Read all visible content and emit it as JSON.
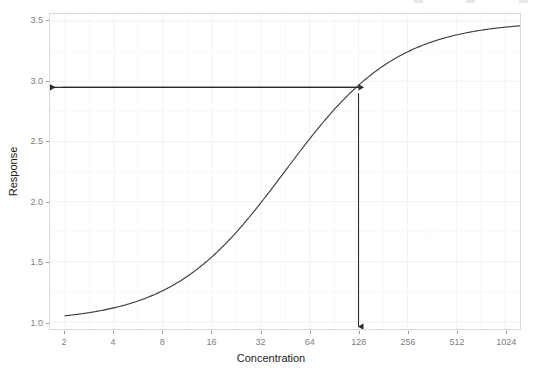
{
  "chart_data": {
    "type": "line",
    "title": "",
    "subtitle": "",
    "xlabel": "Concentration",
    "ylabel": "Response",
    "x_scale": "log2",
    "x_ticks": [
      2,
      4,
      8,
      16,
      32,
      64,
      128,
      256,
      512,
      1024
    ],
    "x_tick_labels": [
      "2",
      "4",
      "8",
      "16",
      "32",
      "64",
      "128",
      "256",
      "512",
      "1024"
    ],
    "xlim": [
      1.62,
      1260
    ],
    "y_ticks": [
      1.0,
      1.5,
      2.0,
      2.5,
      3.0,
      3.5
    ],
    "y_tick_labels": [
      "1.0",
      "1.5",
      "2.0",
      "2.5",
      "3.0",
      "3.5"
    ],
    "ylim": [
      0.94,
      3.56
    ],
    "grid": true,
    "legend": "none",
    "series": [
      {
        "name": "dose-response",
        "color": "#3d3d3d",
        "model": "4PL logistic",
        "params": {
          "bottom": 1.0,
          "top": 3.5,
          "ec50": 45.0,
          "hill": 1.25
        },
        "x": [
          2,
          3,
          4,
          6,
          8,
          11,
          16,
          22,
          32,
          45,
          64,
          90,
          128,
          181,
          256,
          362,
          512,
          724,
          1024,
          1260
        ],
        "y": [
          1.02,
          1.05,
          1.08,
          1.14,
          1.21,
          1.33,
          1.49,
          1.72,
          2.0,
          2.25,
          2.55,
          2.8,
          3.01,
          3.18,
          3.29,
          3.37,
          3.42,
          3.45,
          3.46,
          3.47
        ]
      }
    ],
    "annotations": [
      {
        "name": "response-level-arrow",
        "type": "arrow",
        "direction": "left",
        "label": "",
        "from": {
          "x": 128,
          "y": 2.95
        },
        "to": {
          "x": 1.62,
          "y": 2.95
        },
        "color": "#2b2b2b"
      },
      {
        "name": "concentration-readout-arrow",
        "type": "arrow",
        "direction": "down",
        "label": "",
        "from": {
          "x": 128,
          "y": 2.9
        },
        "to": {
          "x": 128,
          "y": 0.96
        },
        "color": "#2b2b2b"
      }
    ]
  },
  "axes": {
    "x_title": "Concentration",
    "y_title": "Response"
  },
  "colors": {
    "curve": "#3d3d3d",
    "annotation": "#2b2b2b",
    "panel_border": "#d9d9d9",
    "grid_major": "#f2f2f2",
    "grid_minor": "#f8f8f8",
    "tick_label": "#808080",
    "axis_title": "#1a1a1a",
    "background": "#ffffff"
  }
}
